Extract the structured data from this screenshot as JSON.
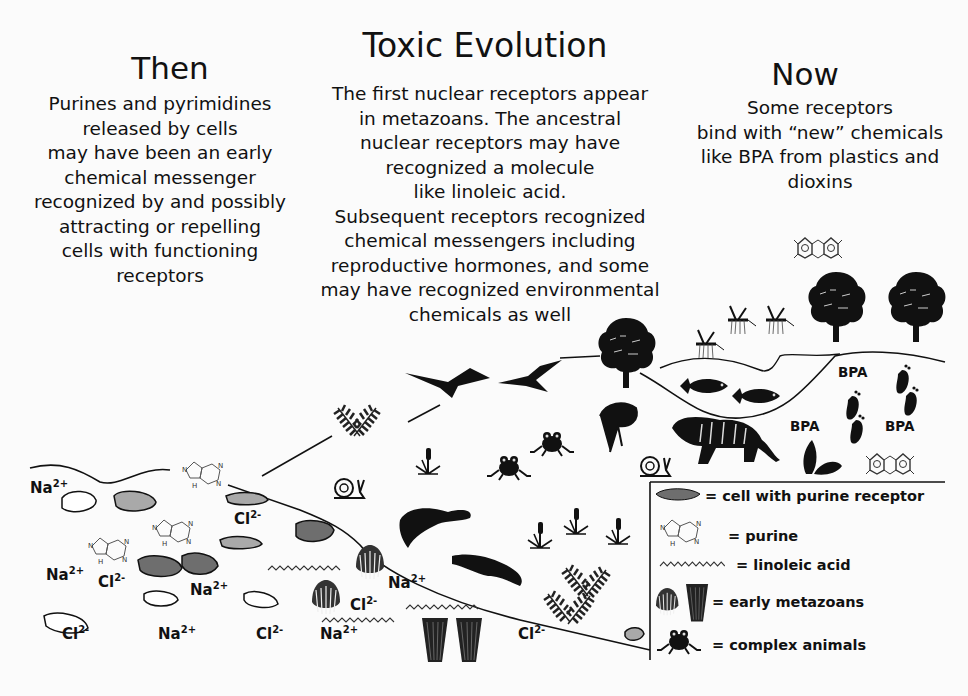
{
  "title": "Toxic Evolution",
  "then": {
    "heading": "Then",
    "lines": [
      "Purines  and pyrimidines",
      "released by cells",
      "may have been an early",
      "chemical messenger",
      "recognized by and possibly",
      "attracting or repelling",
      "cells with functioning",
      "receptors"
    ]
  },
  "middle": {
    "lines": [
      "The first nuclear receptors appear",
      "in metazoans. The ancestral",
      "nuclear receptors may have",
      "recognized a molecule",
      "like linoleic acid.",
      "Subsequent receptors recognized",
      "chemical messengers including",
      "reproductive hormones, and some",
      "may have recognized environmental",
      "chemicals as well"
    ]
  },
  "now": {
    "heading": "Now",
    "lines": [
      "Some receptors",
      "bind with “new” chemicals",
      "like BPA from plastics and",
      "dioxins"
    ]
  },
  "ions": [
    {
      "base": "Na",
      "charge": "2+",
      "x": 30,
      "y": 478
    },
    {
      "base": "Cl",
      "charge": "2-",
      "x": 234,
      "y": 509
    },
    {
      "base": "Na",
      "charge": "2+",
      "x": 46,
      "y": 565
    },
    {
      "base": "Cl",
      "charge": "2-",
      "x": 98,
      "y": 572
    },
    {
      "base": "Na",
      "charge": "2+",
      "x": 190,
      "y": 580
    },
    {
      "base": "Cl",
      "charge": "2-",
      "x": 62,
      "y": 624
    },
    {
      "base": "Na",
      "charge": "2+",
      "x": 158,
      "y": 624
    },
    {
      "base": "Cl",
      "charge": "2-",
      "x": 256,
      "y": 624
    },
    {
      "base": "Cl",
      "charge": "2-",
      "x": 350,
      "y": 595
    },
    {
      "base": "Na",
      "charge": "2+",
      "x": 388,
      "y": 573
    },
    {
      "base": "Na",
      "charge": "2+",
      "x": 320,
      "y": 624
    },
    {
      "base": "Cl",
      "charge": "2-",
      "x": 518,
      "y": 624
    }
  ],
  "bpa_labels": [
    {
      "text": "BPA",
      "x": 838,
      "y": 364
    },
    {
      "text": "BPA",
      "x": 790,
      "y": 418
    },
    {
      "text": "BPA",
      "x": 885,
      "y": 418
    }
  ],
  "legend": {
    "items": [
      {
        "icon": "cell-with-receptor-icon",
        "label": "= cell with purine receptor"
      },
      {
        "icon": "purine-molecule-icon",
        "label": "= purine"
      },
      {
        "icon": "linoleic-acid-icon",
        "label": "= linoleic acid"
      },
      {
        "icon": "early-metazoan-icon",
        "label": "= early metazoans"
      },
      {
        "icon": "frog-icon",
        "label": "= complex animals"
      }
    ]
  },
  "colors": {
    "background": "#fbfbfb",
    "ink": "#111111",
    "cell_dark": "#6e6e6e",
    "cell_light": "#a9a9a9",
    "cell_empty": "#ffffff"
  }
}
